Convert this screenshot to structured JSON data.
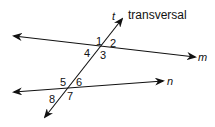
{
  "diagram": {
    "title_label": "transversal",
    "lines": {
      "m": "m",
      "n": "n",
      "t": "t"
    },
    "angles": [
      "1",
      "2",
      "3",
      "4",
      "5",
      "6",
      "7",
      "8"
    ],
    "colors": {
      "stroke": "#111111",
      "background": "#ffffff"
    }
  }
}
